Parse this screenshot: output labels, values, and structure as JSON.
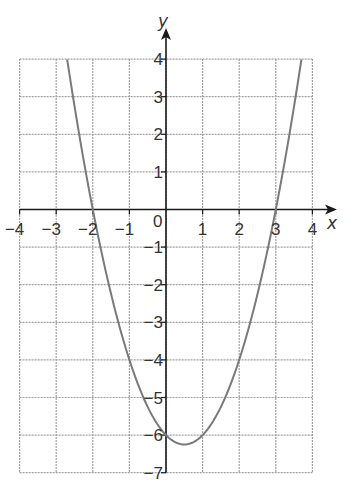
{
  "chart_data": {
    "type": "line",
    "title": "",
    "xlabel": "x",
    "ylabel": "y",
    "xlim": [
      -4,
      4
    ],
    "ylim": [
      -7,
      4
    ],
    "grid": true,
    "x_ticks": [
      -4,
      -3,
      -2,
      -1,
      0,
      1,
      2,
      3,
      4
    ],
    "x_tick_labels": [
      "−4",
      "−3",
      "−2",
      "−1",
      "0",
      "1",
      "2",
      "3",
      "4"
    ],
    "y_ticks": [
      4,
      3,
      2,
      1,
      -1,
      -2,
      -3,
      -4,
      -5,
      -6,
      -7
    ],
    "y_tick_labels": [
      "4",
      "3",
      "2",
      "1",
      "−1",
      "−2",
      "−3",
      "−4",
      "−5",
      "−6",
      "−7"
    ],
    "origin_label": "0",
    "series": [
      {
        "name": "y = x² − x − 6",
        "equation": "y = x^2 - x - 6",
        "x_range": [
          -2.7,
          3.7
        ],
        "x": [
          -2.7,
          -2.5,
          -2,
          -1.5,
          -1,
          -0.5,
          0,
          0.5,
          1,
          1.5,
          2,
          2.5,
          3,
          3.5,
          3.7
        ],
        "y": [
          4.0,
          2.75,
          0,
          -2.25,
          -4,
          -5.25,
          -6,
          -6.25,
          -6,
          -5.25,
          -4,
          -2.25,
          0,
          2.75,
          4.0
        ]
      }
    ],
    "key_points": {
      "roots": [
        -2,
        3
      ],
      "y_intercept": -6,
      "vertex": [
        0.5,
        -6.25
      ]
    },
    "colors": {
      "curve": "#7a7a7a",
      "grid": "#a0a0a0",
      "axes": "#1a1a1a"
    }
  }
}
